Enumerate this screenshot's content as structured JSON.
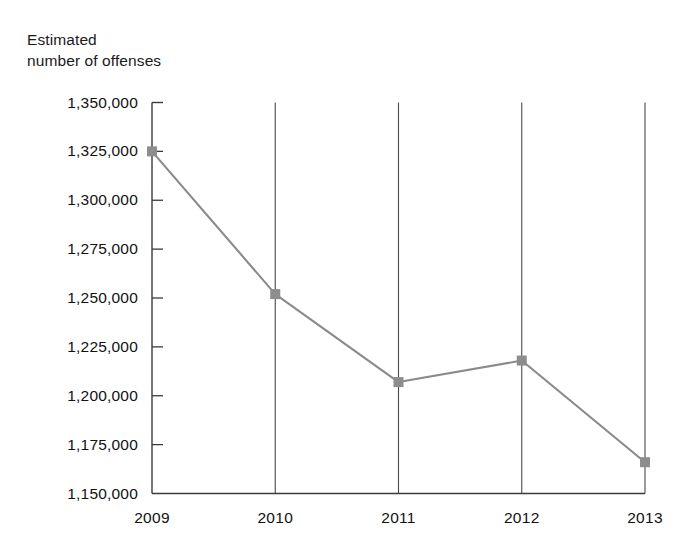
{
  "chart_data": {
    "type": "line",
    "title": "",
    "ylabel": "Estimated\nnumber of offenses",
    "ylabel_line1": "Estimated",
    "ylabel_line2": "number of offenses",
    "xlabel": "",
    "categories": [
      "2009",
      "2010",
      "2011",
      "2012",
      "2013"
    ],
    "values": [
      1325000,
      1252000,
      1207000,
      1218000,
      1166000
    ],
    "series": [
      {
        "name": "Estimated number of offenses",
        "values": [
          1325000,
          1252000,
          1207000,
          1218000,
          1166000
        ]
      }
    ],
    "ylim": [
      1150000,
      1350000
    ],
    "ytick_values": [
      1350000,
      1325000,
      1300000,
      1275000,
      1250000,
      1225000,
      1200000,
      1175000,
      1150000
    ],
    "ytick_labels": [
      "1,350,000",
      "1,325,000",
      "1,300,000",
      "1,275,000",
      "1,250,000",
      "1,225,000",
      "1,200,000",
      "1,175,000",
      "1,150,000"
    ],
    "xtick_labels": [
      "2009",
      "2010",
      "2011",
      "2012",
      "2013"
    ],
    "grid": "vertical-only",
    "legend": "none",
    "marker": "square",
    "colors": {
      "line": "#8a8a8a",
      "marker": "#8d8d8d",
      "axis": "#3a3a3a",
      "gridline": "#4a4a4a",
      "text": "#111111",
      "background": "#ffffff"
    }
  }
}
